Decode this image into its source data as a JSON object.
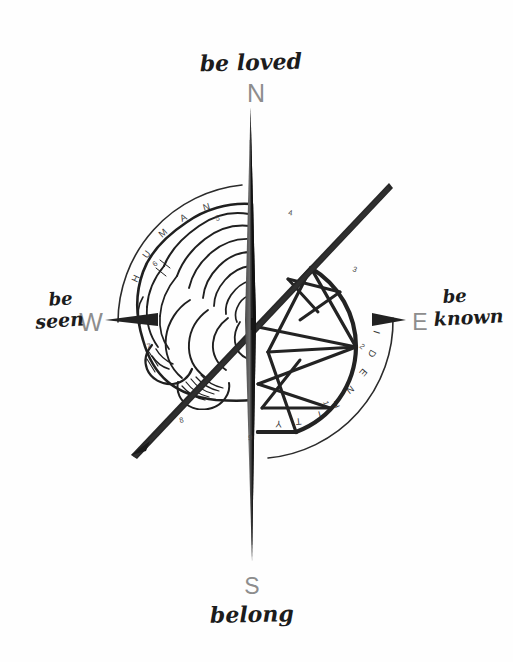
{
  "diagram": {
    "background_color": "#fefefe",
    "ink_color": "#222222",
    "cardinal_color": "#8d8d8d"
  },
  "phrases": {
    "north": "be loved",
    "north_line1": "be",
    "north_line2": "loved",
    "east_line1": "be",
    "east_line2": "known",
    "south": "belong",
    "west_line1": "be",
    "west_line2": "seen"
  },
  "cardinals": {
    "north": "N",
    "east": "E",
    "south": "S",
    "west": "W"
  },
  "arcs": {
    "upper_left_label": "HUMAN",
    "upper_left_letters": [
      "H",
      "U",
      "M",
      "A",
      "N"
    ],
    "lower_right_label": "IDENTITY",
    "lower_right_letters": [
      "I",
      "D",
      "E",
      "N",
      "T",
      "I",
      "T",
      "Y"
    ]
  },
  "tick_numbers": [
    {
      "value": "5",
      "x": 216,
      "y": 221
    },
    {
      "value": "4",
      "x": 288,
      "y": 215
    },
    {
      "value": "3",
      "x": 352,
      "y": 271
    },
    {
      "value": "2",
      "x": 359,
      "y": 347
    },
    {
      "value": "1",
      "x": 323,
      "y": 402
    },
    {
      "value": "9",
      "x": 248,
      "y": 440
    },
    {
      "value": "8",
      "x": 180,
      "y": 423
    },
    {
      "value": "7",
      "x": 147,
      "y": 349
    },
    {
      "value": "6",
      "x": 155,
      "y": 267
    }
  ],
  "elements": {
    "vertical_needle": "compass-needle-vertical",
    "diagonal_needle": "compass-needle-diagonal",
    "west_arrow": "west-arrow-marker",
    "east_arrow": "east-arrow-marker",
    "brain_illustration": "brain-hemisphere-left",
    "gem_illustration": "geometric-crystal-right"
  }
}
